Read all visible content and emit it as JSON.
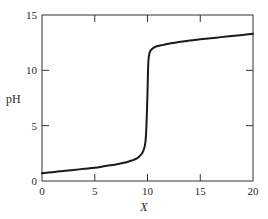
{
  "chart_data": {
    "type": "line",
    "title": "",
    "xlabel": "X",
    "ylabel": "pH",
    "xlim": [
      0,
      20
    ],
    "ylim": [
      0,
      15
    ],
    "x_ticks": [
      0,
      5,
      10,
      15,
      20
    ],
    "y_ticks": [
      0,
      5,
      10,
      15
    ],
    "x_tick_labels": [
      "0",
      "5",
      "10",
      "15",
      "20"
    ],
    "y_tick_labels": [
      "0",
      "5",
      "10",
      "15"
    ],
    "grid": false,
    "legend": null,
    "series": [
      {
        "name": "titration curve",
        "color": "#1a1a1a",
        "x": [
          0,
          1,
          2,
          3,
          4,
          5,
          6,
          7,
          8,
          8.5,
          9,
          9.3,
          9.6,
          9.8,
          9.9,
          10.0,
          10.05,
          10.1,
          10.2,
          10.4,
          10.8,
          11.5,
          12,
          13,
          14,
          15,
          16,
          17,
          18,
          19,
          20
        ],
        "y": [
          0.7,
          0.8,
          0.9,
          1.0,
          1.1,
          1.2,
          1.35,
          1.5,
          1.7,
          1.85,
          2.05,
          2.3,
          2.7,
          3.5,
          5.0,
          8.0,
          10.0,
          11.0,
          11.6,
          11.9,
          12.15,
          12.3,
          12.4,
          12.55,
          12.7,
          12.8,
          12.9,
          13.0,
          13.1,
          13.2,
          13.3
        ]
      }
    ]
  },
  "layout": {
    "plot_left": 42,
    "plot_right": 253,
    "plot_top": 15,
    "plot_bottom": 181
  }
}
